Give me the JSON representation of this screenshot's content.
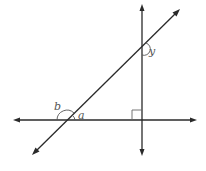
{
  "diagram": {
    "colors": {
      "line": "#2a2a2a",
      "label": "#555555",
      "background": "#ffffff"
    },
    "lines": [
      {
        "name": "horizontal-line",
        "x1": 14,
        "y1": 120,
        "x2": 196,
        "y2": 120,
        "arrows": "both"
      },
      {
        "name": "vertical-line",
        "x1": 142,
        "y1": 5,
        "x2": 142,
        "y2": 155,
        "arrows": "both"
      },
      {
        "name": "transversal-line",
        "x1": 33,
        "y1": 154,
        "x2": 179,
        "y2": 10,
        "arrows": "both"
      }
    ],
    "right_angle": {
      "vertex": [
        142,
        120
      ],
      "size": 10,
      "side": "upper-left"
    },
    "labels": {
      "a": "a",
      "b": "b",
      "y": "y"
    },
    "angles": [
      {
        "name": "angle-a",
        "label": "a",
        "vertex": [
          67,
          120
        ],
        "position": "upper-right"
      },
      {
        "name": "angle-b",
        "label": "b",
        "vertex": [
          67,
          120
        ],
        "position": "upper-left"
      },
      {
        "name": "angle-y",
        "label": "y",
        "vertex": [
          142,
          47
        ],
        "position": "lower-right"
      }
    ]
  }
}
